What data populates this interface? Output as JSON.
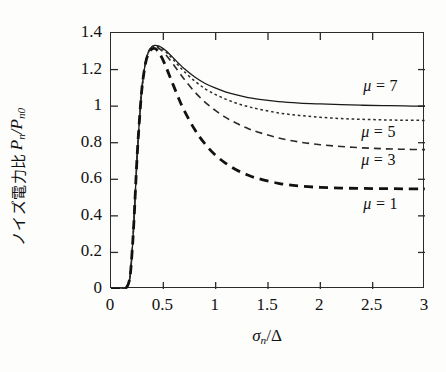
{
  "chart_data": {
    "type": "line",
    "title": "",
    "xlabel": "σn/Δ",
    "ylabel": "ノイズ電力比 Pn/Pn0",
    "ylabel_jp": "ノイズ電力比",
    "ylabel_math_base": "P",
    "ylabel_math_sub1": "n",
    "ylabel_math_slash": "/",
    "ylabel_math_base2": "P",
    "ylabel_math_sub2": "n0",
    "xlabel_sigma": "σ",
    "xlabel_sigma_sub": "n",
    "xlabel_slash": "/",
    "xlabel_delta": "Δ",
    "xlim": [
      0,
      3
    ],
    "ylim": [
      0,
      1.4
    ],
    "xticks": [
      "0",
      "0.5",
      "1",
      "1.5",
      "2",
      "2.5",
      "3"
    ],
    "xtick_values": [
      0,
      0.5,
      1,
      1.5,
      2,
      2.5,
      3
    ],
    "yticks": [
      "0",
      "0.2",
      "0.4",
      "0.6",
      "0.8",
      "1",
      "1.2",
      "1.4"
    ],
    "ytick_values": [
      0,
      0.2,
      0.4,
      0.6,
      0.8,
      1.0,
      1.2,
      1.4
    ],
    "grid": false,
    "legend_position": "inline-right",
    "axis_color": "#2b2b2b",
    "series": [
      {
        "name": "μ = 7",
        "mu": 7,
        "label_mu": "μ",
        "label_eq": "=",
        "label_num": "7",
        "style": "solid",
        "color": "#1a1a1a",
        "width": 1.3,
        "label_x": 2.42,
        "label_y": 1.1,
        "x": [
          0.0,
          0.1,
          0.15,
          0.18,
          0.2,
          0.22,
          0.25,
          0.28,
          0.3,
          0.33,
          0.36,
          0.39,
          0.42,
          0.45,
          0.48,
          0.52,
          0.56,
          0.6,
          0.65,
          0.7,
          0.8,
          0.9,
          1.0,
          1.1,
          1.2,
          1.3,
          1.4,
          1.6,
          1.8,
          2.0,
          2.2,
          2.4,
          2.6,
          2.8,
          3.0
        ],
        "y": [
          0.0,
          0.0,
          0.01,
          0.06,
          0.19,
          0.38,
          0.73,
          0.99,
          1.12,
          1.24,
          1.3,
          1.325,
          1.332,
          1.33,
          1.322,
          1.305,
          1.284,
          1.261,
          1.232,
          1.205,
          1.159,
          1.124,
          1.098,
          1.077,
          1.061,
          1.048,
          1.038,
          1.025,
          1.017,
          1.012,
          1.008,
          1.005,
          1.003,
          1.001,
          1.0
        ]
      },
      {
        "name": "μ = 5",
        "mu": 5,
        "label_mu": "μ",
        "label_eq": "=",
        "label_num": "5",
        "style": "dotted",
        "color": "#2a2a2a",
        "width": 1.5,
        "label_x": 2.4,
        "label_y": 0.845,
        "x": [
          0.0,
          0.1,
          0.15,
          0.18,
          0.2,
          0.22,
          0.25,
          0.28,
          0.3,
          0.33,
          0.36,
          0.39,
          0.42,
          0.45,
          0.48,
          0.52,
          0.56,
          0.6,
          0.65,
          0.7,
          0.8,
          0.9,
          1.0,
          1.1,
          1.2,
          1.3,
          1.4,
          1.6,
          1.8,
          2.0,
          2.2,
          2.4,
          2.6,
          2.8,
          3.0
        ],
        "y": [
          0.0,
          0.0,
          0.01,
          0.06,
          0.19,
          0.38,
          0.73,
          0.99,
          1.12,
          1.24,
          1.3,
          1.324,
          1.33,
          1.327,
          1.318,
          1.299,
          1.276,
          1.251,
          1.219,
          1.189,
          1.137,
          1.095,
          1.063,
          1.037,
          1.016,
          0.999,
          0.985,
          0.963,
          0.949,
          0.939,
          0.932,
          0.928,
          0.925,
          0.923,
          0.922
        ]
      },
      {
        "name": "μ = 3",
        "mu": 3,
        "label_mu": "μ",
        "label_eq": "=",
        "label_num": "3",
        "style": "dashed",
        "color": "#2a2a2a",
        "width": 1.6,
        "label_x": 2.4,
        "label_y": 0.695,
        "x": [
          0.0,
          0.1,
          0.15,
          0.18,
          0.2,
          0.22,
          0.25,
          0.28,
          0.3,
          0.33,
          0.36,
          0.39,
          0.42,
          0.45,
          0.48,
          0.52,
          0.56,
          0.6,
          0.65,
          0.7,
          0.8,
          0.9,
          1.0,
          1.1,
          1.2,
          1.3,
          1.4,
          1.6,
          1.8,
          2.0,
          2.2,
          2.4,
          2.6,
          2.8,
          3.0
        ],
        "y": [
          0.0,
          0.0,
          0.01,
          0.06,
          0.19,
          0.38,
          0.73,
          0.99,
          1.12,
          1.24,
          1.298,
          1.32,
          1.325,
          1.319,
          1.306,
          1.283,
          1.255,
          1.225,
          1.185,
          1.147,
          1.078,
          1.021,
          0.975,
          0.937,
          0.906,
          0.88,
          0.859,
          0.826,
          0.804,
          0.789,
          0.779,
          0.772,
          0.767,
          0.764,
          0.762
        ]
      },
      {
        "name": "μ = 1",
        "mu": 1,
        "label_mu": "μ",
        "label_eq": "=",
        "label_num": "1",
        "style": "dashed-thick",
        "color": "#111111",
        "width": 2.8,
        "label_x": 2.42,
        "label_y": 0.455,
        "x": [
          0.0,
          0.1,
          0.15,
          0.18,
          0.2,
          0.22,
          0.25,
          0.28,
          0.3,
          0.33,
          0.36,
          0.39,
          0.42,
          0.45,
          0.48,
          0.52,
          0.56,
          0.6,
          0.65,
          0.7,
          0.8,
          0.9,
          1.0,
          1.1,
          1.2,
          1.3,
          1.4,
          1.6,
          1.8,
          2.0,
          2.2,
          2.4,
          2.6,
          2.8,
          3.0
        ],
        "y": [
          0.0,
          0.0,
          0.01,
          0.06,
          0.19,
          0.38,
          0.73,
          0.99,
          1.12,
          1.235,
          1.29,
          1.312,
          1.315,
          1.3,
          1.272,
          1.222,
          1.165,
          1.108,
          1.038,
          0.975,
          0.872,
          0.792,
          0.731,
          0.686,
          0.651,
          0.625,
          0.605,
          0.578,
          0.563,
          0.556,
          0.552,
          0.55,
          0.549,
          0.548,
          0.548
        ]
      }
    ]
  }
}
